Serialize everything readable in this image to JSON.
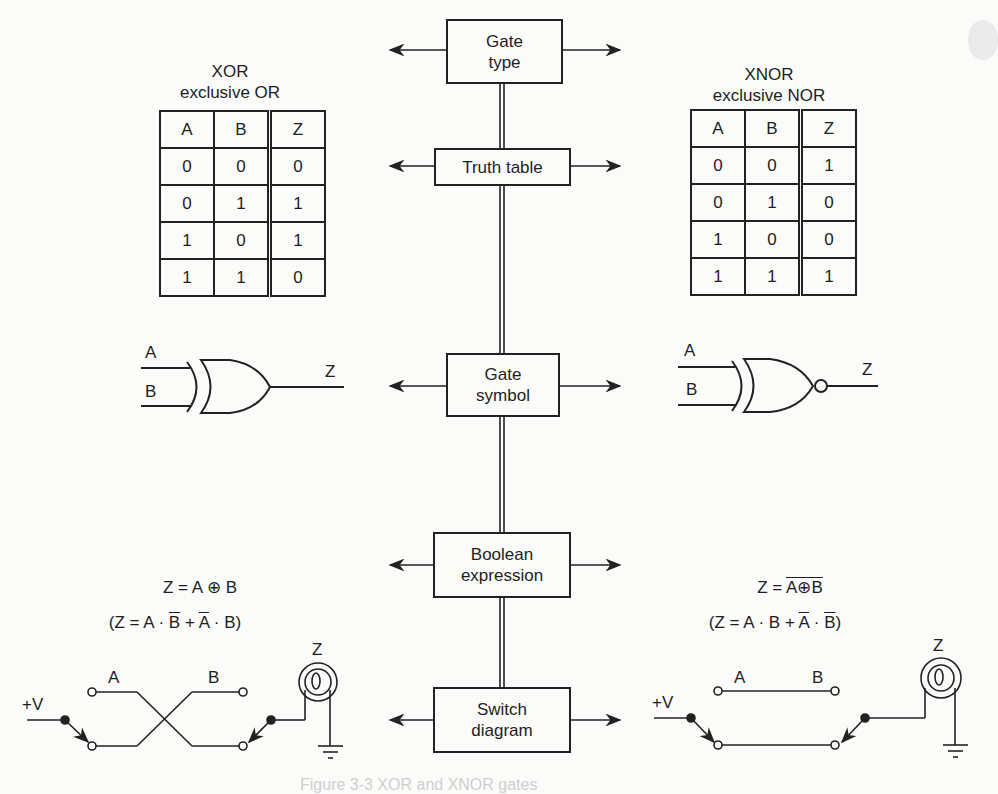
{
  "central_column": {
    "boxes": [
      {
        "id": "gate-type",
        "lines": [
          "Gate",
          "type"
        ]
      },
      {
        "id": "truth-table",
        "lines": [
          "Truth table"
        ]
      },
      {
        "id": "gate-symbol",
        "lines": [
          "Gate",
          "symbol"
        ]
      },
      {
        "id": "boolean-expression",
        "lines": [
          "Boolean",
          "expression"
        ]
      },
      {
        "id": "switch-diagram",
        "lines": [
          "Switch",
          "diagram"
        ]
      }
    ]
  },
  "xor": {
    "title": "XOR",
    "subtitle": "exclusive OR",
    "truth_table": {
      "headers": [
        "A",
        "B",
        "Z"
      ],
      "rows": [
        [
          "0",
          "0",
          "0"
        ],
        [
          "0",
          "1",
          "1"
        ],
        [
          "1",
          "0",
          "1"
        ],
        [
          "1",
          "1",
          "0"
        ]
      ]
    },
    "symbol": {
      "input_a": "A",
      "input_b": "B",
      "output": "Z"
    },
    "expression": {
      "main": "Z = A ⊕ B",
      "expanded_prefix": "(Z = A · ",
      "expanded_b_bar": "B",
      "expanded_plus": " + ",
      "expanded_a_bar": "A",
      "expanded_suffix": " · B)"
    },
    "switch": {
      "supply": "+V",
      "switch_a": "A",
      "switch_b": "B",
      "lamp": "Z"
    }
  },
  "xnor": {
    "title": "XNOR",
    "subtitle": "exclusive NOR",
    "truth_table": {
      "headers": [
        "A",
        "B",
        "Z"
      ],
      "rows": [
        [
          "0",
          "0",
          "1"
        ],
        [
          "0",
          "1",
          "0"
        ],
        [
          "1",
          "0",
          "0"
        ],
        [
          "1",
          "1",
          "1"
        ]
      ]
    },
    "symbol": {
      "input_a": "A",
      "input_b": "B",
      "output": "Z"
    },
    "expression": {
      "main_prefix": "Z = ",
      "main_overlined": "A⊕B",
      "expanded_prefix": "(Z = A · B + ",
      "expanded_a_bar": "A",
      "expanded_dot": " · ",
      "expanded_b_bar": "B",
      "expanded_suffix": ")"
    },
    "switch": {
      "supply": "+V",
      "switch_a": "A",
      "switch_b": "B",
      "lamp": "Z"
    }
  },
  "caption": "Figure 3-3  XOR and XNOR gates"
}
